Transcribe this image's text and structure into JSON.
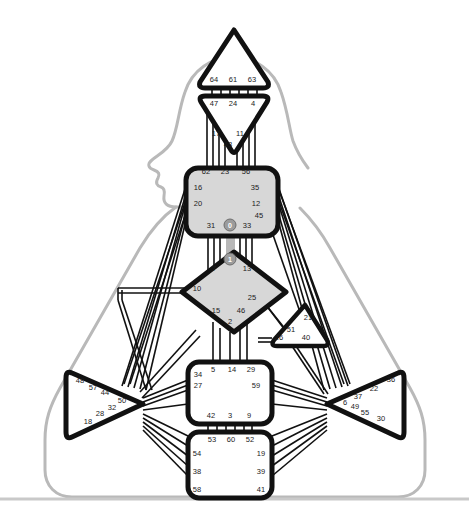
{
  "figure": {
    "background": "#ffffff",
    "silhouette_color": "#b9b9b9",
    "node_outline_color": "#111111",
    "node_fill_white": "#ffffff",
    "node_fill_gray": "#d7d7d7",
    "edge_color": "#111111",
    "label_color": "#1b1b1b",
    "marker_fill": "#9c9c9c",
    "baseline_color": "#c9c9c9"
  },
  "regions": [
    {
      "id": "top-triangle",
      "name": "top-triangle-node",
      "shape": "triangle-up",
      "fill": "#ffffff",
      "labels": [
        {
          "text": "64",
          "x": 214,
          "y": 82
        },
        {
          "text": "61",
          "x": 233,
          "y": 82
        },
        {
          "text": "63",
          "x": 252,
          "y": 82
        }
      ]
    },
    {
      "id": "inverted-triangle",
      "name": "inverted-triangle-node",
      "shape": "triangle-down",
      "fill": "#ffffff",
      "labels": [
        {
          "text": "47",
          "x": 214,
          "y": 106
        },
        {
          "text": "24",
          "x": 233,
          "y": 106
        },
        {
          "text": "4",
          "x": 253,
          "y": 106
        },
        {
          "text": "17",
          "x": 216,
          "y": 136
        },
        {
          "text": "11",
          "x": 240,
          "y": 136
        },
        {
          "text": "43",
          "x": 228,
          "y": 147
        }
      ]
    },
    {
      "id": "gray-box",
      "name": "gray-box-node",
      "shape": "rounded-rect",
      "fill": "#d7d7d7",
      "labels": [
        {
          "text": "62",
          "x": 206,
          "y": 174
        },
        {
          "text": "23",
          "x": 225,
          "y": 174
        },
        {
          "text": "56",
          "x": 246,
          "y": 174
        },
        {
          "text": "16",
          "x": 198,
          "y": 190
        },
        {
          "text": "35",
          "x": 255,
          "y": 190
        },
        {
          "text": "20",
          "x": 198,
          "y": 206
        },
        {
          "text": "12",
          "x": 256,
          "y": 206
        },
        {
          "text": "45",
          "x": 257,
          "y": 218
        },
        {
          "text": "31",
          "x": 211,
          "y": 228
        },
        {
          "text": "33",
          "x": 247,
          "y": 228
        }
      ],
      "marker": {
        "text": "0",
        "x": 230,
        "y": 225
      }
    },
    {
      "id": "diamond",
      "name": "diamond-node",
      "shape": "diamond",
      "fill": "#d7d7d7",
      "labels": [
        {
          "text": "7",
          "x": 214,
          "y": 271
        },
        {
          "text": "13",
          "x": 247,
          "y": 271
        },
        {
          "text": "10",
          "x": 197,
          "y": 291
        },
        {
          "text": "25",
          "x": 252,
          "y": 300
        },
        {
          "text": "15",
          "x": 216,
          "y": 313
        },
        {
          "text": "46",
          "x": 241,
          "y": 313
        },
        {
          "text": "2",
          "x": 230,
          "y": 324
        }
      ],
      "marker": {
        "text": "1",
        "x": 230,
        "y": 259
      }
    },
    {
      "id": "small-right-triangle",
      "name": "small-right-triangle-node",
      "shape": "triangle-up",
      "fill": "#ffffff",
      "labels": [
        {
          "text": "21",
          "x": 308,
          "y": 316
        },
        {
          "text": "51",
          "x": 291,
          "y": 329
        },
        {
          "text": "26",
          "x": 277,
          "y": 336
        },
        {
          "text": "40",
          "x": 305,
          "y": 336
        }
      ]
    },
    {
      "id": "left-triangle",
      "name": "left-triangle-node",
      "shape": "triangle-left",
      "fill": "#ffffff",
      "labels": [
        {
          "text": "48",
          "x": 80,
          "y": 382
        },
        {
          "text": "57",
          "x": 93,
          "y": 389
        },
        {
          "text": "44",
          "x": 104,
          "y": 394
        },
        {
          "text": "50",
          "x": 121,
          "y": 404
        },
        {
          "text": "32",
          "x": 111,
          "y": 409
        },
        {
          "text": "28",
          "x": 99,
          "y": 415
        },
        {
          "text": "18",
          "x": 87,
          "y": 423
        }
      ]
    },
    {
      "id": "right-triangle",
      "name": "right-triangle-node",
      "shape": "triangle-right",
      "fill": "#ffffff",
      "labels": [
        {
          "text": "36",
          "x": 392,
          "y": 381
        },
        {
          "text": "22",
          "x": 374,
          "y": 390
        },
        {
          "text": "37",
          "x": 357,
          "y": 399
        },
        {
          "text": "6",
          "x": 345,
          "y": 404
        },
        {
          "text": "49",
          "x": 354,
          "y": 406
        },
        {
          "text": "55",
          "x": 364,
          "y": 413
        },
        {
          "text": "30",
          "x": 380,
          "y": 419
        }
      ]
    },
    {
      "id": "mid-box",
      "name": "mid-box-node",
      "shape": "rounded-rect",
      "fill": "#ffffff",
      "labels": [
        {
          "text": "34",
          "x": 197,
          "y": 375
        },
        {
          "text": "5",
          "x": 213,
          "y": 371
        },
        {
          "text": "14",
          "x": 231,
          "y": 371
        },
        {
          "text": "29",
          "x": 250,
          "y": 371
        },
        {
          "text": "27",
          "x": 197,
          "y": 385
        },
        {
          "text": "59",
          "x": 254,
          "y": 385
        },
        {
          "text": "42",
          "x": 211,
          "y": 416
        },
        {
          "text": "3",
          "x": 230,
          "y": 416
        },
        {
          "text": "9",
          "x": 248,
          "y": 416
        }
      ]
    },
    {
      "id": "bottom-box",
      "name": "bottom-box-node",
      "shape": "rounded-rect",
      "fill": "#ffffff",
      "labels": [
        {
          "text": "53",
          "x": 211,
          "y": 440
        },
        {
          "text": "60",
          "x": 229,
          "y": 440
        },
        {
          "text": "52",
          "x": 248,
          "y": 440
        },
        {
          "text": "54",
          "x": 195,
          "y": 454
        },
        {
          "text": "19",
          "x": 259,
          "y": 454
        },
        {
          "text": "38",
          "x": 195,
          "y": 472
        },
        {
          "text": "39",
          "x": 259,
          "y": 472
        },
        {
          "text": "58",
          "x": 195,
          "y": 490
        },
        {
          "text": "41",
          "x": 259,
          "y": 490
        }
      ]
    }
  ]
}
